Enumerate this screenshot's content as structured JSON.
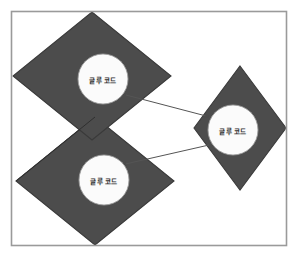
{
  "diagram": {
    "title": "",
    "frame": {
      "stroke": "#9a9a9a",
      "fill": "#ffffff",
      "x": 11,
      "y": 11,
      "width": 276,
      "height": 235
    },
    "colors": {
      "diamond_fill": "#4c4c4c",
      "diamond_stroke": "#3a3a3a",
      "circle_fill": "#fbfbfb",
      "circle_stroke": "#9d9d9d",
      "connector": "#555555",
      "label_text": "#2b2b2b",
      "background": "#ffffff"
    },
    "nodes": [
      {
        "id": "node-top-left",
        "label": "글루 코드",
        "shape": "diamond-with-circle",
        "diamond": {
          "cx": 92,
          "cy": 76,
          "rx": 79,
          "ry": 64
        },
        "circle": {
          "cx": 103,
          "cy": 79,
          "r": 25
        }
      },
      {
        "id": "node-bottom-left",
        "label": "글루 코드",
        "shape": "diamond-with-circle",
        "diamond": {
          "cx": 95,
          "cy": 181,
          "rx": 79,
          "ry": 64
        },
        "circle": {
          "cx": 104,
          "cy": 180,
          "r": 25
        }
      },
      {
        "id": "node-right",
        "label": "글루 코드",
        "shape": "diamond-with-circle",
        "diamond": {
          "cx": 240,
          "cy": 128,
          "rx": 46,
          "ry": 62
        },
        "circle": {
          "cx": 233,
          "cy": 130,
          "r": 25
        }
      }
    ],
    "connectors": [
      {
        "id": "connector-top-left-to-right",
        "from": "node-top-left",
        "to": "node-right",
        "direction": "forward",
        "arrowhead": "right",
        "x1": 126,
        "y1": 95,
        "x2": 210,
        "y2": 117
      },
      {
        "id": "connector-right-to-bottom-left",
        "from": "node-right",
        "to": "node-bottom-left",
        "direction": "forward",
        "arrowhead": "left",
        "x1": 209,
        "y1": 145,
        "x2": 121,
        "y2": 165
      }
    ]
  }
}
